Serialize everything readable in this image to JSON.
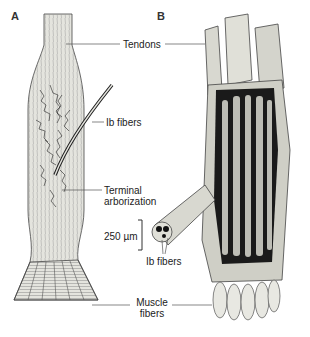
{
  "figure": {
    "panels": [
      {
        "id": "A",
        "letter": "A",
        "subject": "muscle-tendon junction with Ib fiber terminal arborization"
      },
      {
        "id": "B",
        "letter": "B",
        "subject": "3D cutaway of tendon organ capsule"
      }
    ],
    "labels": {
      "tendons": "Tendons",
      "ib_fibers_top": "Ib fibers",
      "terminal_line1": "Terminal",
      "terminal_line2": "arborization",
      "scale_bar": "250 µm",
      "ib_fibers_bottom": "Ib fibers",
      "muscle_line1": "Muscle",
      "muscle_line2": "fibers"
    },
    "colors": {
      "ink": "#222222",
      "tissue_light": "#dcdcd6",
      "tissue_mid": "#b8b8b0",
      "dark_fiber": "#111111",
      "background": "#ffffff"
    }
  }
}
